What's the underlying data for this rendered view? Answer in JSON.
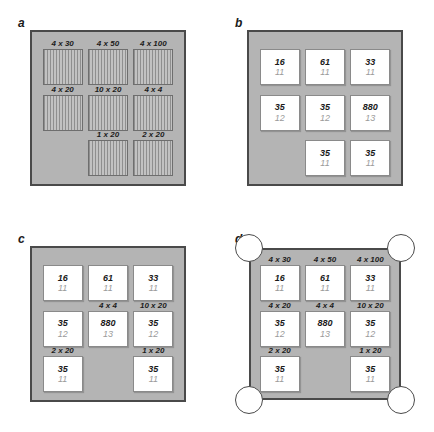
{
  "figure": {
    "panels": [
      {
        "letter": "a",
        "box_type": "striped",
        "has_corner_circles": false,
        "cells": [
          {
            "label": "4 x 30",
            "top": "",
            "bottom": "",
            "present": true
          },
          {
            "label": "4 x 50",
            "top": "",
            "bottom": "",
            "present": true
          },
          {
            "label": "4 x 100",
            "top": "",
            "bottom": "",
            "present": true
          },
          {
            "label": "4 x 20",
            "top": "",
            "bottom": "",
            "present": true
          },
          {
            "label": "10 x 20",
            "top": "",
            "bottom": "",
            "present": true
          },
          {
            "label": "4 x 4",
            "top": "",
            "bottom": "",
            "present": true
          },
          {
            "label": "",
            "top": "",
            "bottom": "",
            "present": false
          },
          {
            "label": "1 x 20",
            "top": "",
            "bottom": "",
            "present": true
          },
          {
            "label": "2 x 20",
            "top": "",
            "bottom": "",
            "present": true
          }
        ]
      },
      {
        "letter": "b",
        "box_type": "value",
        "has_corner_circles": false,
        "cells": [
          {
            "label": "",
            "top": "16",
            "bottom": "11",
            "present": true
          },
          {
            "label": "",
            "top": "61",
            "bottom": "11",
            "present": true
          },
          {
            "label": "",
            "top": "33",
            "bottom": "11",
            "present": true
          },
          {
            "label": "",
            "top": "35",
            "bottom": "12",
            "present": true
          },
          {
            "label": "",
            "top": "35",
            "bottom": "12",
            "present": true
          },
          {
            "label": "",
            "top": "880",
            "bottom": "13",
            "present": true
          },
          {
            "label": "",
            "top": "",
            "bottom": "",
            "present": false
          },
          {
            "label": "",
            "top": "35",
            "bottom": "11",
            "present": true
          },
          {
            "label": "",
            "top": "35",
            "bottom": "11",
            "present": true
          }
        ]
      },
      {
        "letter": "c",
        "box_type": "value",
        "has_corner_circles": false,
        "cells": [
          {
            "label": "",
            "top": "16",
            "bottom": "11",
            "present": true
          },
          {
            "label": "",
            "top": "61",
            "bottom": "11",
            "present": true
          },
          {
            "label": "",
            "top": "33",
            "bottom": "11",
            "present": true
          },
          {
            "label": "",
            "top": "35",
            "bottom": "12",
            "present": true
          },
          {
            "label": "4 x 4",
            "top": "880",
            "bottom": "13",
            "present": true
          },
          {
            "label": "10 x 20",
            "top": "35",
            "bottom": "12",
            "present": true
          },
          {
            "label": "2 x 20",
            "top": "35",
            "bottom": "11",
            "present": true
          },
          {
            "label": "",
            "top": "",
            "bottom": "",
            "present": false
          },
          {
            "label": "1 x 20",
            "top": "35",
            "bottom": "11",
            "present": true
          }
        ]
      },
      {
        "letter": "d",
        "box_type": "value",
        "has_corner_circles": true,
        "cells": [
          {
            "label": "4 x 30",
            "top": "16",
            "bottom": "11",
            "present": true
          },
          {
            "label": "4 x 50",
            "top": "61",
            "bottom": "11",
            "present": true
          },
          {
            "label": "4 x 100",
            "top": "33",
            "bottom": "11",
            "present": true
          },
          {
            "label": "4 x 20",
            "top": "35",
            "bottom": "12",
            "present": true
          },
          {
            "label": "4 x 4",
            "top": "880",
            "bottom": "13",
            "present": true
          },
          {
            "label": "10 x 20",
            "top": "35",
            "bottom": "12",
            "present": true
          },
          {
            "label": "2 x 20",
            "top": "35",
            "bottom": "11",
            "present": true
          },
          {
            "label": "",
            "top": "",
            "bottom": "",
            "present": false
          },
          {
            "label": "1 x 20",
            "top": "35",
            "bottom": "11",
            "present": true
          }
        ]
      }
    ],
    "colors": {
      "board_fill": "#b4b4b4",
      "board_border": "#4a4a4a",
      "box_fill": "#ffffff",
      "box_border": "#8a8a8a",
      "value_top": "#1a1a1a",
      "value_bottom": "#9a9a9a",
      "stripe_dark": "#8f8f8f",
      "stripe_light": "#c2c2c2",
      "circle_fill": "#ffffff",
      "circle_border": "#4a4a4a"
    }
  }
}
